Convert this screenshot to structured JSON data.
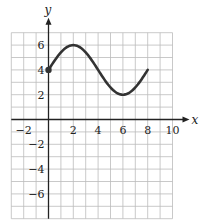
{
  "chart_data": {
    "type": "line",
    "title": "",
    "xlabel": "x",
    "ylabel": "y",
    "xlim": [
      -3,
      10
    ],
    "ylim": [
      -8,
      7
    ],
    "grid": true,
    "x_ticks": [
      -2,
      2,
      4,
      6,
      8,
      10
    ],
    "x_tick_labels": [
      "−2",
      "2",
      "4",
      "6",
      "8",
      "10"
    ],
    "y_ticks": [
      6,
      4,
      2,
      -2,
      -4,
      -6
    ],
    "y_tick_labels": [
      "6",
      "4",
      "2",
      "−2",
      "−4",
      "−6"
    ],
    "series": [
      {
        "name": "curve",
        "description": "sinusoid starting at (0,4), max at (2,6), min at (6,2), ending at (8,4)",
        "x": [
          0,
          1,
          2,
          3,
          4,
          5,
          6,
          7,
          8
        ],
        "y": [
          4,
          5.41,
          6,
          5.41,
          4,
          2.59,
          2,
          2.59,
          4
        ],
        "start_point_marker": {
          "x": 0,
          "y": 4
        }
      }
    ],
    "colors": {
      "curve": "#333333",
      "grid": "#bbbbbb",
      "axis": "#222222"
    }
  }
}
